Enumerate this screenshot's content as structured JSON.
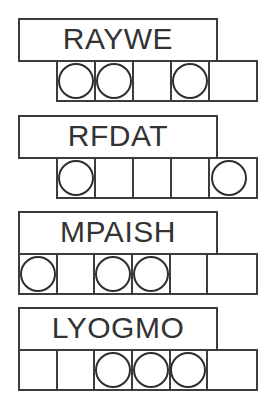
{
  "sheet": {
    "title": "word-circle-puzzle-sheet",
    "background_color": "#ffffff",
    "line_color": "#3c3c3c",
    "text_color": "#333333"
  },
  "blocks": [
    {
      "word": "RAYWE",
      "word_box": {
        "left": 18,
        "top": 18,
        "width": 200,
        "height": 44
      },
      "grid": {
        "left": 56,
        "top": 60,
        "width": 202,
        "height": 42,
        "cell_count": 5,
        "cells": [
          {
            "marked": true,
            "marker": "circle"
          },
          {
            "marked": true,
            "marker": "circle"
          },
          {
            "marked": false,
            "marker": ""
          },
          {
            "marked": true,
            "marker": "circle"
          },
          {
            "marked": false,
            "marker": ""
          }
        ]
      }
    },
    {
      "word": "RFDAT",
      "word_box": {
        "left": 18,
        "top": 115,
        "width": 200,
        "height": 44
      },
      "grid": {
        "left": 56,
        "top": 157,
        "width": 202,
        "height": 42,
        "cell_count": 5,
        "cells": [
          {
            "marked": true,
            "marker": "circle"
          },
          {
            "marked": false,
            "marker": ""
          },
          {
            "marked": false,
            "marker": ""
          },
          {
            "marked": false,
            "marker": ""
          },
          {
            "marked": true,
            "marker": "circle"
          }
        ]
      }
    },
    {
      "word": "MPAISH",
      "word_box": {
        "left": 18,
        "top": 211,
        "width": 200,
        "height": 44
      },
      "grid": {
        "left": 18,
        "top": 253,
        "width": 240,
        "height": 42,
        "cell_count": 6,
        "cells": [
          {
            "marked": true,
            "marker": "circle"
          },
          {
            "marked": false,
            "marker": ""
          },
          {
            "marked": true,
            "marker": "circle"
          },
          {
            "marked": true,
            "marker": "circle"
          },
          {
            "marked": false,
            "marker": ""
          },
          {
            "marked": false,
            "marker": ""
          }
        ]
      }
    },
    {
      "word": "LYOGMO",
      "word_box": {
        "left": 18,
        "top": 307,
        "width": 200,
        "height": 44
      },
      "grid": {
        "left": 18,
        "top": 349,
        "width": 240,
        "height": 42,
        "cell_count": 6,
        "cells": [
          {
            "marked": false,
            "marker": ""
          },
          {
            "marked": false,
            "marker": ""
          },
          {
            "marked": true,
            "marker": "circle"
          },
          {
            "marked": true,
            "marker": "circle"
          },
          {
            "marked": true,
            "marker": "circle"
          },
          {
            "marked": false,
            "marker": ""
          }
        ]
      }
    }
  ]
}
